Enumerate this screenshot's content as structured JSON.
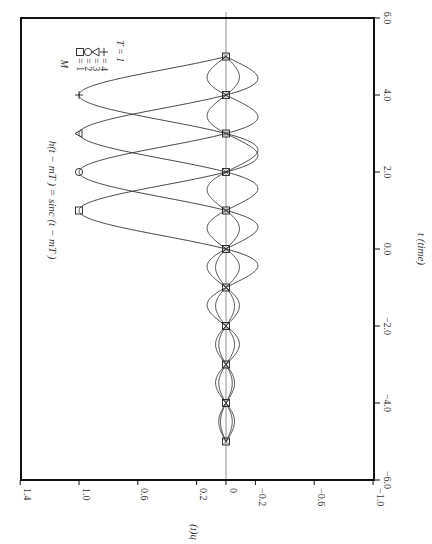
{
  "chart_data": {
    "type": "line",
    "orientation": "rotated-90-clockwise",
    "title": "",
    "annotation": "h(t − mT) = sinc (t − mT)",
    "xlabel": "t (time)",
    "ylabel": "h(t)",
    "xlim": [
      -6.0,
      6.0
    ],
    "ylim": [
      -1.0,
      1.4
    ],
    "x_ticks": [
      "−6.0",
      "−4.0",
      "−2.0",
      "0.0",
      "2.0",
      "4.0",
      "6.0"
    ],
    "x_tick_values": [
      -6,
      -4,
      -2,
      0,
      2,
      4,
      6
    ],
    "y_ticks": [
      "1.4",
      "1.0",
      "0.6",
      "0.2",
      "0",
      "−0.2",
      "−0.6",
      "−1.0"
    ],
    "y_tick_values": [
      1.4,
      1.0,
      0.6,
      0.2,
      0,
      -0.2,
      -0.6,
      -1.0
    ],
    "grid": false,
    "zero_line": true,
    "legend": {
      "title": "M",
      "entries": [
        {
          "marker": "square",
          "symbol": "□",
          "label": "= 1"
        },
        {
          "marker": "circle",
          "symbol": "○",
          "label": "= 2"
        },
        {
          "marker": "triangle",
          "symbol": "△",
          "label": "= 3"
        },
        {
          "marker": "plus",
          "symbol": "+",
          "label": "= 4"
        }
      ],
      "note": "T = 1",
      "position": "upper-right (rotated: top-left)"
    },
    "t_range": [
      -5,
      5
    ],
    "series": [
      {
        "name": "M = 1",
        "function": "sinc(t - 1)",
        "shift": 1,
        "marker": "square",
        "peak": {
          "t": 1,
          "h": 1.0
        }
      },
      {
        "name": "M = 2",
        "function": "sinc(t - 2)",
        "shift": 2,
        "marker": "circle",
        "peak": {
          "t": 2,
          "h": 1.0
        }
      },
      {
        "name": "M = 3",
        "function": "sinc(t - 3)",
        "shift": 3,
        "marker": "triangle",
        "peak": {
          "t": 3,
          "h": 1.0
        }
      },
      {
        "name": "M = 4",
        "function": "sinc(t - 4)",
        "shift": 4,
        "marker": "plus",
        "peak": {
          "t": 4,
          "h": 1.0
        }
      }
    ],
    "zero_crossing_markers": {
      "marker": "square",
      "t": [
        -5,
        -4,
        -3,
        -2,
        -1,
        0,
        1,
        2,
        3,
        4,
        5
      ],
      "h": 0
    }
  },
  "labels": {
    "annotation_h": "h",
    "annotation_rest": "(t − mT ) = sinc (t − mT )",
    "xlabel": "t (time)",
    "ylabel": "h(t)",
    "legend_title": "M",
    "legend_note": "T = 1"
  },
  "colors": {
    "axis": "#111111",
    "curve": "#333333",
    "zero_line": "#777777",
    "background": "#ffffff"
  }
}
